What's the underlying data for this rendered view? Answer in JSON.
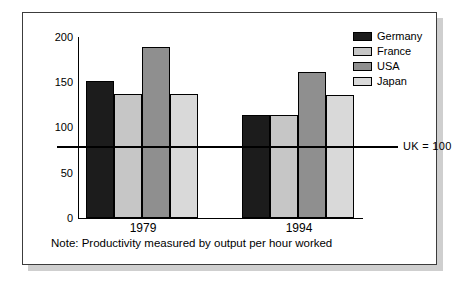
{
  "chart_data": {
    "type": "bar",
    "title": "",
    "xlabel": "",
    "ylabel": "",
    "ylim": [
      0,
      200
    ],
    "yticks": [
      0,
      50,
      100,
      150,
      200
    ],
    "ytick_labels": [
      "0",
      "50",
      "100",
      "150",
      "200"
    ],
    "grid": false,
    "legend_position": "top-right",
    "categories": [
      "1979",
      "1994"
    ],
    "series": [
      {
        "name": "Germany",
        "color": "#1c1c1c",
        "values": [
          151,
          113
        ]
      },
      {
        "name": "France",
        "color": "#c6c6c6",
        "values": [
          136,
          113
        ]
      },
      {
        "name": "USA",
        "color": "#8f8f8f",
        "values": [
          188,
          160
        ]
      },
      {
        "name": "Japan",
        "color": "#d9d9d9",
        "values": [
          136,
          135
        ]
      }
    ],
    "annotations": [
      {
        "name": "reference-line",
        "value": 100,
        "label": "UK = 100"
      }
    ],
    "note": "Note: Productivity measured by output per hour worked"
  },
  "legend": {
    "items": [
      {
        "label": "Germany"
      },
      {
        "label": "France"
      },
      {
        "label": "USA"
      },
      {
        "label": "Japan"
      }
    ]
  },
  "axis": {
    "y_labels": [
      "200",
      "150",
      "100",
      "50",
      "0"
    ]
  },
  "x_labels": [
    "1979",
    "1994"
  ],
  "reference": {
    "label": "UK = 100"
  },
  "note": {
    "text": "Note: Productivity measured by output per hour worked"
  }
}
